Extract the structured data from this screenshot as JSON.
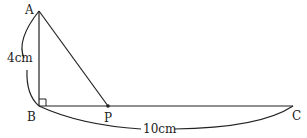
{
  "diagram": {
    "points": {
      "A": {
        "label": "A",
        "x": 39,
        "y": 11
      },
      "B": {
        "label": "B",
        "x": 39,
        "y": 106
      },
      "P": {
        "label": "P",
        "x": 108,
        "y": 106
      },
      "C": {
        "label": "C",
        "x": 293,
        "y": 106
      }
    },
    "measurements": {
      "AB": "4cm",
      "BC": "10cm"
    },
    "right_angle_at": "B",
    "stroke_color": "#222222"
  }
}
